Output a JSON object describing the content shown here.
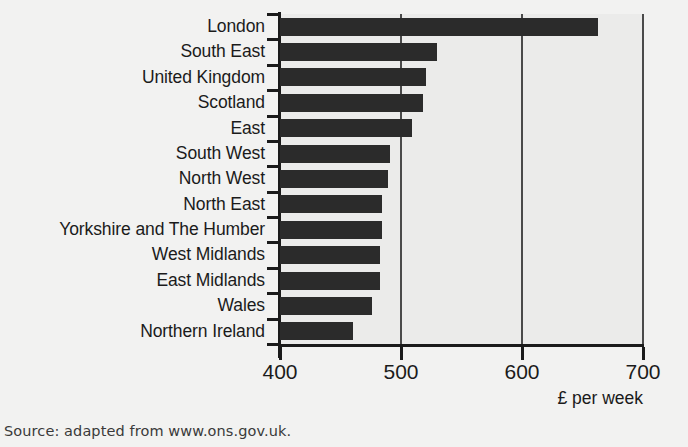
{
  "chart_data": {
    "type": "bar",
    "orientation": "horizontal",
    "title": "",
    "xlabel": "£ per week",
    "ylabel": "",
    "xlim": [
      400,
      700
    ],
    "xticks": [
      400,
      500,
      600,
      700
    ],
    "grid": true,
    "legend": null,
    "categories": [
      "London",
      "South East",
      "United Kingdom",
      "Scotland",
      "East",
      "South West",
      "North West",
      "North East",
      "Yorkshire and The Humber",
      "West Midlands",
      "East Midlands",
      "Wales",
      "Northern Ireland"
    ],
    "values": [
      663,
      530,
      521,
      518,
      509,
      491,
      489,
      484,
      484,
      483,
      483,
      476,
      460
    ]
  },
  "axis": {
    "x_tick_labels": [
      "400",
      "500",
      "600",
      "700"
    ],
    "x_axis_title": "£ per week"
  },
  "source": {
    "note": "Source: adapted from www.ons.gov.uk."
  },
  "colors": {
    "bar": "#2b2b2b",
    "plot_background": "#ebebea",
    "page_background": "#f2f2f1",
    "axis": "#1b1b1b",
    "gridline": "#4a4a4a"
  }
}
